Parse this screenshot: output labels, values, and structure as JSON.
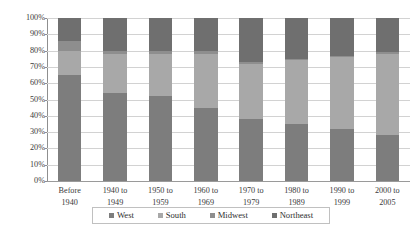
{
  "chart_data": {
    "type": "bar",
    "subtype": "stacked-percentage",
    "title": "",
    "xlabel": "",
    "ylabel": "",
    "ylim": [
      0,
      100
    ],
    "yunit": "%",
    "grid": true,
    "legend_position": "bottom",
    "categories": [
      "Before 1940",
      "1940 to 1949",
      "1950 to 1959",
      "1960 to 1969",
      "1970 to 1979",
      "1980 to 1989",
      "1990 to 1999",
      "2000 to 2005"
    ],
    "category_lines": [
      [
        "Before",
        "1940"
      ],
      [
        "1940 to",
        "1949"
      ],
      [
        "1950 to",
        "1959"
      ],
      [
        "1960 to",
        "1969"
      ],
      [
        "1970 to",
        "1979"
      ],
      [
        "1980 to",
        "1989"
      ],
      [
        "1990 to",
        "1999"
      ],
      [
        "2000 to",
        "2005"
      ]
    ],
    "ytick_labels": [
      "100%",
      "90%",
      "80%",
      "70%",
      "60%",
      "50%",
      "40%",
      "30%",
      "20%",
      "10%",
      "0%"
    ],
    "ytick_values": [
      100,
      90,
      80,
      70,
      60,
      50,
      40,
      30,
      20,
      10,
      0
    ],
    "series": [
      {
        "name": "West",
        "color": "#7d7d7d",
        "values": [
          65,
          54,
          52,
          45,
          38,
          35,
          32,
          28
        ]
      },
      {
        "name": "South",
        "color": "#a8a8a8",
        "values": [
          15,
          24,
          26,
          33,
          34,
          39,
          44,
          50
        ]
      },
      {
        "name": "Midwest",
        "color": "#8e8e8e",
        "values": [
          6,
          2,
          2,
          2,
          1,
          1,
          1,
          1
        ]
      },
      {
        "name": "Northeast",
        "color": "#6f6f6f",
        "values": [
          14,
          20,
          20,
          20,
          27,
          25,
          23,
          21
        ]
      }
    ]
  },
  "legend": {
    "items": [
      {
        "label": "West",
        "color": "#7d7d7d"
      },
      {
        "label": "South",
        "color": "#a8a8a8"
      },
      {
        "label": "Midwest",
        "color": "#8e8e8e"
      },
      {
        "label": "Northeast",
        "color": "#6f6f6f"
      }
    ]
  }
}
